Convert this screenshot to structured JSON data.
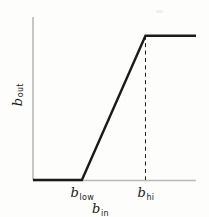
{
  "figure": {
    "name": "piecewise-linear-transfer-function",
    "background_color": "#fdfdfb",
    "ink_color": "#1a1a1a",
    "axis_color": "#b9b9b9"
  },
  "labels": {
    "xlabel_var": "b",
    "xlabel_sub": "in",
    "ylabel_var": "b",
    "ylabel_sub": "out",
    "tick_low_var": "b",
    "tick_low_sub": "low",
    "tick_hi_var": "b",
    "tick_hi_sub": "hi"
  },
  "chart_data": {
    "type": "line",
    "title": "",
    "xlabel": "b_in",
    "ylabel": "b_out",
    "xlim": [
      0,
      1
    ],
    "ylim": [
      0,
      1
    ],
    "grid": false,
    "legend": false,
    "annotations": [
      {
        "name": "b_low_tick",
        "text": "b_low",
        "x": 0.3,
        "y": 0
      },
      {
        "name": "b_hi_tick",
        "text": "b_hi",
        "x": 0.69,
        "y": 0
      },
      {
        "name": "b_hi_dashed_guide",
        "text": "",
        "x": 0.69,
        "y": 0.885
      }
    ],
    "series": [
      {
        "name": "transfer-curve",
        "style": "solid",
        "color": "#1a1a1a",
        "width": 2.4,
        "x": [
          0.0,
          0.3,
          0.69,
          1.0
        ],
        "y": [
          0.0,
          0.0,
          0.885,
          0.885
        ]
      },
      {
        "name": "b-hi-dashed-dropline",
        "style": "dashed",
        "color": "#1a1a1a",
        "width": 1.0,
        "x": [
          0.69,
          0.69
        ],
        "y": [
          0.885,
          0.0
        ]
      }
    ]
  }
}
